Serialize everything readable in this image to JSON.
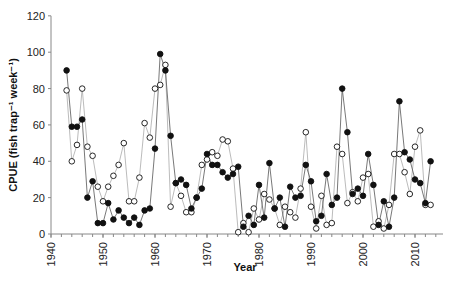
{
  "chart_data": {
    "type": "line",
    "title": "",
    "xlabel": "Year",
    "ylabel": "CPUE (fish trap⁻¹ week⁻¹)",
    "xlim": [
      1940,
      2015
    ],
    "ylim": [
      0,
      120
    ],
    "x_ticks": [
      1940,
      1950,
      1960,
      1970,
      1980,
      1990,
      2000,
      2010
    ],
    "y_ticks": [
      0,
      20,
      40,
      60,
      80,
      100,
      120
    ],
    "grid": false,
    "legend": null,
    "x": [
      1943,
      1944,
      1945,
      1946,
      1947,
      1948,
      1949,
      1950,
      1951,
      1952,
      1953,
      1954,
      1955,
      1956,
      1957,
      1958,
      1959,
      1960,
      1961,
      1962,
      1963,
      1964,
      1965,
      1966,
      1967,
      1968,
      1969,
      1970,
      1971,
      1972,
      1973,
      1974,
      1975,
      1976,
      1977,
      1978,
      1979,
      1980,
      1981,
      1982,
      1983,
      1984,
      1985,
      1986,
      1987,
      1988,
      1989,
      1990,
      1991,
      1992,
      1993,
      1994,
      1995,
      1996,
      1997,
      1998,
      1999,
      2000,
      2001,
      2002,
      2003,
      2004,
      2005,
      2006,
      2007,
      2008,
      2009,
      2010,
      2011,
      2012,
      2013
    ],
    "series": [
      {
        "name": "filled",
        "marker": "filled-circle",
        "line_color": "#555555",
        "values": [
          90,
          59,
          59,
          63,
          20,
          29,
          6,
          6,
          17,
          8,
          13,
          9,
          6,
          9,
          5,
          13,
          14,
          47,
          99,
          90,
          54,
          28,
          30,
          27,
          14,
          20,
          25,
          44,
          38,
          38,
          34,
          31,
          33,
          37,
          4,
          10,
          5,
          27,
          9,
          39,
          14,
          20,
          4,
          26,
          20,
          21,
          38,
          29,
          7,
          10,
          33,
          16,
          20,
          80,
          56,
          22,
          25,
          21,
          44,
          27,
          5,
          18,
          4,
          20,
          73,
          45,
          41,
          30,
          28,
          17,
          40
        ]
      },
      {
        "name": "open",
        "marker": "open-circle",
        "line_color": "#aaaaaa",
        "values": [
          79,
          40,
          49,
          80,
          48,
          43,
          26,
          18,
          26,
          32,
          38,
          50,
          18,
          18,
          31,
          61,
          53,
          80,
          82,
          93,
          15,
          28,
          21,
          12,
          12,
          20,
          38,
          41,
          45,
          43,
          52,
          51,
          36,
          1,
          6,
          1,
          14,
          8,
          22,
          19,
          14,
          5,
          15,
          12,
          9,
          25,
          56,
          15,
          3,
          21,
          5,
          6,
          48,
          44,
          17,
          23,
          18,
          31,
          33,
          4,
          7,
          3,
          16,
          44,
          44,
          34,
          22,
          48,
          57,
          16,
          16
        ]
      }
    ]
  }
}
